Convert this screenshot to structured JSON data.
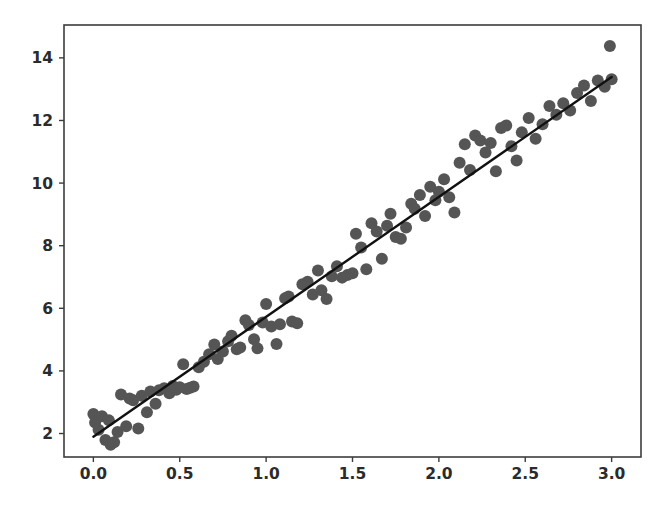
{
  "chart_data": {
    "type": "scatter",
    "title": "",
    "subtitle": "",
    "xlabel": "",
    "ylabel": "",
    "xlim": [
      -0.17,
      3.17
    ],
    "ylim": [
      1.25,
      15.05
    ],
    "xticks": [
      0.0,
      0.5,
      1.0,
      1.5,
      2.0,
      2.5,
      3.0
    ],
    "xtick_labels": [
      "0.0",
      "0.5",
      "1.0",
      "1.5",
      "2.0",
      "2.5",
      "3.0"
    ],
    "yticks": [
      2,
      4,
      6,
      8,
      10,
      12,
      14
    ],
    "ytick_labels": [
      "2",
      "4",
      "6",
      "8",
      "10",
      "12",
      "14"
    ],
    "grid": false,
    "legend": null,
    "annotations": [],
    "marker_color": "#555555",
    "marker_size": 9,
    "line_color": "#111111",
    "axis_color": "#3c3c3c",
    "background_color": "#ffffff",
    "series": [
      {
        "name": "observations",
        "type": "scatter",
        "points": [
          [
            0.0,
            2.62
          ],
          [
            0.01,
            2.35
          ],
          [
            0.03,
            2.12
          ],
          [
            0.05,
            2.55
          ],
          [
            0.07,
            1.79
          ],
          [
            0.09,
            2.42
          ],
          [
            0.1,
            1.64
          ],
          [
            0.12,
            1.72
          ],
          [
            0.14,
            2.05
          ],
          [
            0.16,
            3.25
          ],
          [
            0.19,
            2.23
          ],
          [
            0.21,
            3.12
          ],
          [
            0.23,
            3.06
          ],
          [
            0.26,
            2.16
          ],
          [
            0.28,
            3.21
          ],
          [
            0.31,
            2.68
          ],
          [
            0.33,
            3.34
          ],
          [
            0.36,
            2.95
          ],
          [
            0.38,
            3.38
          ],
          [
            0.41,
            3.45
          ],
          [
            0.44,
            3.29
          ],
          [
            0.46,
            3.52
          ],
          [
            0.48,
            3.4
          ],
          [
            0.5,
            3.48
          ],
          [
            0.52,
            4.21
          ],
          [
            0.54,
            3.42
          ],
          [
            0.56,
            3.46
          ],
          [
            0.58,
            3.5
          ],
          [
            0.61,
            4.12
          ],
          [
            0.64,
            4.29
          ],
          [
            0.67,
            4.53
          ],
          [
            0.7,
            4.84
          ],
          [
            0.72,
            4.38
          ],
          [
            0.75,
            4.62
          ],
          [
            0.78,
            4.95
          ],
          [
            0.8,
            5.12
          ],
          [
            0.83,
            4.69
          ],
          [
            0.85,
            4.75
          ],
          [
            0.88,
            5.62
          ],
          [
            0.9,
            5.47
          ],
          [
            0.93,
            5.01
          ],
          [
            0.95,
            4.72
          ],
          [
            0.98,
            5.55
          ],
          [
            1.0,
            6.14
          ],
          [
            1.03,
            5.42
          ],
          [
            1.06,
            4.86
          ],
          [
            1.08,
            5.49
          ],
          [
            1.11,
            6.32
          ],
          [
            1.13,
            6.38
          ],
          [
            1.15,
            5.58
          ],
          [
            1.18,
            5.52
          ],
          [
            1.21,
            6.77
          ],
          [
            1.24,
            6.85
          ],
          [
            1.27,
            6.44
          ],
          [
            1.3,
            7.21
          ],
          [
            1.32,
            6.58
          ],
          [
            1.35,
            6.3
          ],
          [
            1.38,
            7.02
          ],
          [
            1.41,
            7.34
          ],
          [
            1.44,
            6.98
          ],
          [
            1.47,
            7.06
          ],
          [
            1.5,
            7.12
          ],
          [
            1.52,
            8.38
          ],
          [
            1.55,
            7.94
          ],
          [
            1.58,
            7.25
          ],
          [
            1.61,
            8.72
          ],
          [
            1.64,
            8.45
          ],
          [
            1.67,
            7.58
          ],
          [
            1.7,
            8.64
          ],
          [
            1.72,
            9.02
          ],
          [
            1.75,
            8.28
          ],
          [
            1.78,
            8.22
          ],
          [
            1.81,
            8.58
          ],
          [
            1.84,
            9.34
          ],
          [
            1.86,
            9.18
          ],
          [
            1.89,
            9.62
          ],
          [
            1.92,
            8.95
          ],
          [
            1.95,
            9.88
          ],
          [
            1.98,
            9.45
          ],
          [
            2.0,
            9.72
          ],
          [
            2.03,
            10.12
          ],
          [
            2.06,
            9.55
          ],
          [
            2.09,
            9.06
          ],
          [
            2.12,
            10.65
          ],
          [
            2.15,
            11.24
          ],
          [
            2.18,
            10.42
          ],
          [
            2.21,
            11.52
          ],
          [
            2.24,
            11.36
          ],
          [
            2.27,
            10.98
          ],
          [
            2.3,
            11.28
          ],
          [
            2.33,
            10.38
          ],
          [
            2.36,
            11.76
          ],
          [
            2.39,
            11.84
          ],
          [
            2.42,
            11.18
          ],
          [
            2.45,
            10.72
          ],
          [
            2.48,
            11.62
          ],
          [
            2.52,
            12.08
          ],
          [
            2.56,
            11.42
          ],
          [
            2.6,
            11.88
          ],
          [
            2.64,
            12.46
          ],
          [
            2.68,
            12.18
          ],
          [
            2.72,
            12.55
          ],
          [
            2.76,
            12.32
          ],
          [
            2.8,
            12.88
          ],
          [
            2.84,
            13.12
          ],
          [
            2.88,
            12.62
          ],
          [
            2.92,
            13.28
          ],
          [
            2.96,
            13.08
          ],
          [
            2.99,
            14.38
          ],
          [
            3.0,
            13.32
          ]
        ]
      },
      {
        "name": "fit-line",
        "type": "line",
        "slope": 3.83,
        "intercept": 1.9,
        "endpoints": [
          [
            0.0,
            1.9
          ],
          [
            3.0,
            13.39
          ]
        ]
      }
    ]
  }
}
